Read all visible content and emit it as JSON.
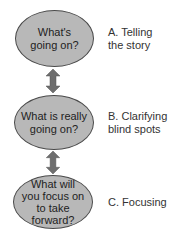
{
  "steps": [
    {
      "question": "What's going on?",
      "label": "A. Telling the story",
      "label_line1": "A. Telling",
      "label_line2": "the story",
      "q1": "What's",
      "q2": "going on?"
    },
    {
      "question": "What is really going on?",
      "label": "B. Clarifying blind spots",
      "label_line1": "B. Clarifying",
      "label_line2": "blind spots",
      "q1": "What is really",
      "q2": "going on?"
    },
    {
      "question": "What will you focus on to take forward?",
      "label": "C. Focusing",
      "q1": "What will",
      "q2": "you focus on",
      "q3": "to take",
      "q4": "forward?"
    }
  ],
  "colors": {
    "ellipse_fill": "#b8b8b8",
    "ellipse_stroke": "#4a4a4a",
    "arrow": "#6e6e6e"
  }
}
